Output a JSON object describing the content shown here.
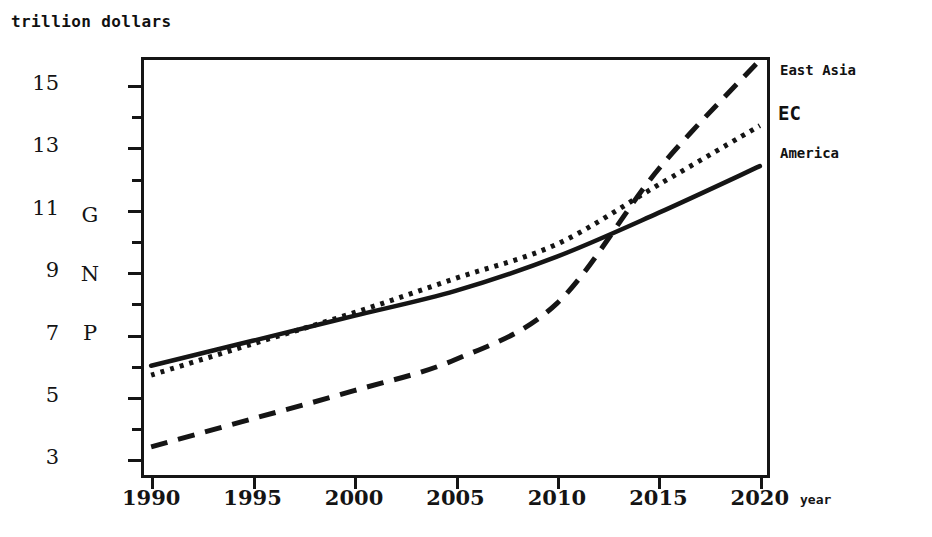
{
  "chart_data": {
    "type": "line",
    "title": "trillion dollars",
    "ylabel": "GNP",
    "xlabel": "year",
    "x": [
      1990,
      1995,
      2000,
      2005,
      2010,
      2015,
      2020
    ],
    "xlim": [
      1989.5,
      2020.5
    ],
    "ylim": [
      2.4,
      15.9
    ],
    "yticks_major": [
      3,
      5,
      7,
      9,
      11,
      13,
      15
    ],
    "yticks_minor": [
      4,
      6,
      8,
      10,
      12,
      14
    ],
    "grid": false,
    "legend_position": "right-end-of-line",
    "series": [
      {
        "name": "East Asia",
        "style": "dashed",
        "values": [
          3.4,
          4.3,
          5.2,
          6.2,
          8.0,
          12.3,
          15.8
        ]
      },
      {
        "name": "EC",
        "style": "dotted",
        "values": [
          5.7,
          6.7,
          7.7,
          8.8,
          9.9,
          11.8,
          13.7
        ]
      },
      {
        "name": "America",
        "style": "solid",
        "values": [
          6.0,
          6.8,
          7.6,
          8.4,
          9.5,
          10.9,
          12.4
        ]
      }
    ]
  },
  "axis": {
    "unit_title": "trillion dollars",
    "x_title": "year",
    "y_title_letters": [
      "G",
      "N",
      "P"
    ],
    "y_tick_labels": [
      "15",
      "13",
      "11",
      "9",
      "7",
      "5",
      "3"
    ],
    "x_tick_labels": [
      "1990",
      "1995",
      "2000",
      "2005",
      "2010",
      "2015",
      "2020"
    ]
  },
  "legend": {
    "east_asia": "East Asia",
    "ec": "EC",
    "america": "America"
  },
  "colors": {
    "ink": "#151515",
    "background": "#ffffff"
  }
}
